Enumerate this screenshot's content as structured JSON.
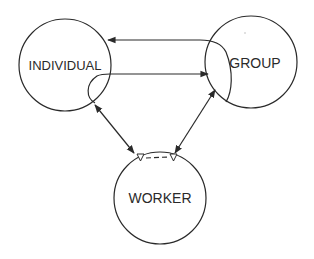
{
  "diagram": {
    "nodes": [
      {
        "id": "individual",
        "label": "INDIVIDUAL",
        "cx": 65,
        "cy": 65,
        "r": 46
      },
      {
        "id": "group",
        "label": "GROUP",
        "cx": 251,
        "cy": 62,
        "r": 46
      },
      {
        "id": "worker",
        "label": "WORKER",
        "cx": 160,
        "cy": 198,
        "r": 46
      }
    ],
    "edges": [
      {
        "from": "group",
        "to": "individual",
        "style": "curved",
        "arrow": "end"
      },
      {
        "from": "individual",
        "to": "group",
        "style": "curved",
        "arrow": "end"
      },
      {
        "from": "individual",
        "to": "worker",
        "style": "straight",
        "arrow": "both"
      },
      {
        "from": "group",
        "to": "worker",
        "style": "straight",
        "arrow": "both"
      }
    ],
    "worker_link": {
      "style": "dashed",
      "endpoints": "open-triangles"
    },
    "colors": {
      "stroke": "#2a2a2a",
      "background": "#ffffff"
    }
  }
}
